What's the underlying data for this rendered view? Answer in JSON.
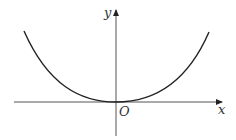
{
  "figure": {
    "type": "function-graph",
    "axes": {
      "x_label": "x",
      "y_label": "y",
      "origin_label": "O"
    },
    "curve": {
      "shape": "parabola-like",
      "vertex": [
        0,
        0
      ],
      "symmetric_about": "y-axis"
    },
    "colors": {
      "line": "#222222",
      "label": "#333333",
      "background": "#ffffff"
    }
  }
}
